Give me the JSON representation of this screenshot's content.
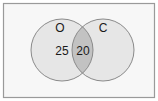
{
  "diagram": {
    "type": "venn",
    "sets": [
      {
        "id": "O",
        "label": "O",
        "only_count": "25"
      },
      {
        "id": "C",
        "label": "C",
        "only_count": ""
      }
    ],
    "intersection": {
      "sets": [
        "O",
        "C"
      ],
      "count": "20"
    },
    "colors": {
      "frame_border": "#9a9a9a",
      "background": "#f7f7f7",
      "circle_fill": "#e6e6e6",
      "circle_stroke": "#8a8a8a",
      "intersection_fill": "#c2c2c2"
    }
  }
}
